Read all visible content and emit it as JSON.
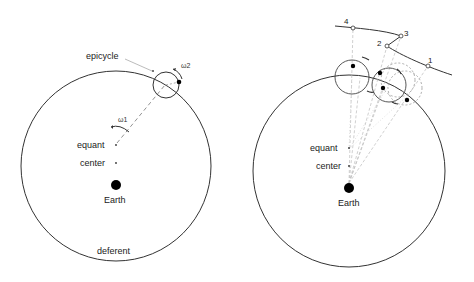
{
  "left_panel": {
    "labels": {
      "epicycle": "epicycle",
      "omega2": "ω2",
      "omega1": "ω1",
      "equant": "equant",
      "center": "center",
      "earth": "Earth",
      "deferent": "deferent"
    }
  },
  "right_panel": {
    "labels": {
      "equant": "equant",
      "center": "center",
      "earth": "Earth"
    },
    "path_points": [
      "1",
      "2",
      "3",
      "4"
    ]
  },
  "colors": {
    "line": "#333333",
    "guide": "#aaaaaa",
    "fill": "#000000"
  }
}
